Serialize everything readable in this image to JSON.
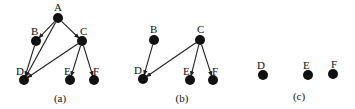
{
  "figure": {
    "panels": [
      {
        "id": "a",
        "caption": "(a)",
        "caption_pos": [
          60,
          102
        ],
        "nodes": [
          {
            "label": "A",
            "x": 58,
            "y": 18,
            "lx": 54,
            "ly": 11
          },
          {
            "label": "B",
            "x": 36,
            "y": 41,
            "lx": 31,
            "ly": 35
          },
          {
            "label": "C",
            "x": 82,
            "y": 41,
            "lx": 80,
            "ly": 35
          },
          {
            "label": "D",
            "x": 24,
            "y": 80,
            "lx": 16,
            "ly": 75
          },
          {
            "label": "E",
            "x": 70,
            "y": 80,
            "lx": 64,
            "ly": 75
          },
          {
            "label": "F",
            "x": 94,
            "y": 80,
            "lx": 93,
            "ly": 75
          }
        ],
        "edges": [
          {
            "from": "A",
            "to": "B"
          },
          {
            "from": "A",
            "to": "C"
          },
          {
            "from": "A",
            "to": "D"
          },
          {
            "from": "B",
            "to": "D"
          },
          {
            "from": "C",
            "to": "D"
          },
          {
            "from": "C",
            "to": "E"
          },
          {
            "from": "C",
            "to": "F"
          }
        ]
      },
      {
        "id": "b",
        "caption": "(b)",
        "caption_pos": [
          182,
          102
        ],
        "nodes": [
          {
            "label": "B",
            "x": 154,
            "y": 40,
            "lx": 150,
            "ly": 33
          },
          {
            "label": "C",
            "x": 200,
            "y": 40,
            "lx": 197,
            "ly": 33
          },
          {
            "label": "D",
            "x": 143,
            "y": 79,
            "lx": 134,
            "ly": 74
          },
          {
            "label": "E",
            "x": 190,
            "y": 80,
            "lx": 183,
            "ly": 75
          },
          {
            "label": "F",
            "x": 213,
            "y": 80,
            "lx": 212,
            "ly": 75
          }
        ],
        "edges": [
          {
            "from": "B",
            "to": "D"
          },
          {
            "from": "C",
            "to": "D"
          },
          {
            "from": "C",
            "to": "E"
          },
          {
            "from": "C",
            "to": "F"
          }
        ]
      },
      {
        "id": "c",
        "caption": "(c)",
        "caption_pos": [
          299,
          100
        ],
        "nodes": [
          {
            "label": "D",
            "x": 263,
            "y": 75,
            "lx": 257,
            "ly": 69
          },
          {
            "label": "E",
            "x": 308,
            "y": 75,
            "lx": 303,
            "ly": 69
          },
          {
            "label": "F",
            "x": 333,
            "y": 74,
            "lx": 331,
            "ly": 68
          }
        ],
        "edges": []
      }
    ],
    "style": {
      "node_color": "#111111",
      "edge_color": "#222222",
      "background": "#ffffff",
      "node_radius": 5
    }
  }
}
